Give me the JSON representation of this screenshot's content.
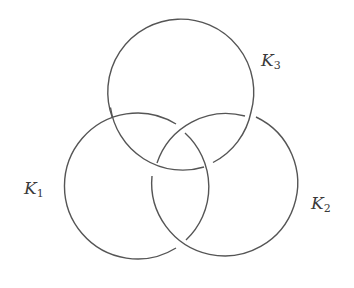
{
  "diagram": {
    "type": "borromean-rings",
    "stroke_color": "#555555",
    "background": "#ffffff",
    "rings": [
      {
        "id": "K1",
        "label_main": "K",
        "label_sub": "1",
        "cx": 137,
        "cy": 186,
        "r": 73
      },
      {
        "id": "K2",
        "label_main": "K",
        "label_sub": "2",
        "cx": 224,
        "cy": 186,
        "r": 73
      },
      {
        "id": "K3",
        "label_main": "K",
        "label_sub": "3",
        "cx": 181,
        "cy": 96,
        "r": 73
      }
    ],
    "crossings": [
      {
        "at": [
          111,
          113
        ],
        "over": "K1",
        "under": "K3"
      },
      {
        "at": [
          250,
          113
        ],
        "over": "K3",
        "under": "K2"
      },
      {
        "at": [
          181,
          128
        ],
        "over": "K2",
        "under": "K1"
      },
      {
        "at": [
          154,
          170
        ],
        "over": "K3",
        "under": "K2"
      },
      {
        "at": [
          208,
          165
        ],
        "over": "K1",
        "under": "K3"
      },
      {
        "at": [
          181,
          245
        ],
        "over": "K2",
        "under": "K1"
      }
    ]
  }
}
